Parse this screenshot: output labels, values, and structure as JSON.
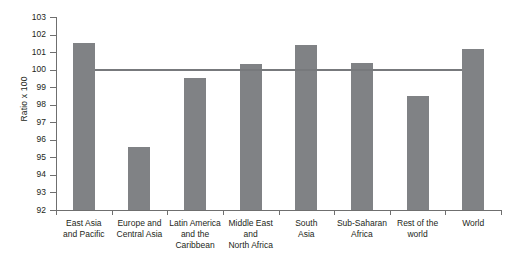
{
  "chart_data": {
    "type": "bar",
    "title": "",
    "subtitle": "",
    "xlabel": "",
    "ylabel": "Ratio x 100",
    "categories": [
      "East Asia\nand Pacific",
      "Europe and\nCentral Asia",
      "Latin America\nand the\nCaribbean",
      "Middle East\nand\nNorth Africa",
      "South\nAsia",
      "Sub-Saharan\nAfrica",
      "Rest of the\nworld",
      "World"
    ],
    "values": [
      101.5,
      95.6,
      99.5,
      100.3,
      101.4,
      100.4,
      98.5,
      101.2
    ],
    "ylim": [
      92,
      103
    ],
    "ytick_labels": [
      "103",
      "102",
      "101",
      "100",
      "99",
      "98",
      "97",
      "96",
      "95",
      "94",
      "93",
      "92"
    ],
    "ytick_values": [
      103,
      102,
      101,
      100,
      99,
      98,
      97,
      96,
      95,
      94,
      93,
      92
    ],
    "grid": false,
    "legend": null,
    "reference_line": {
      "value": 100,
      "label": ""
    },
    "colors": {
      "bar": "#808285",
      "reference_line": "#77797c",
      "axis": "#6f6f6f",
      "text": "#231f20",
      "background": "#ffffff"
    }
  }
}
